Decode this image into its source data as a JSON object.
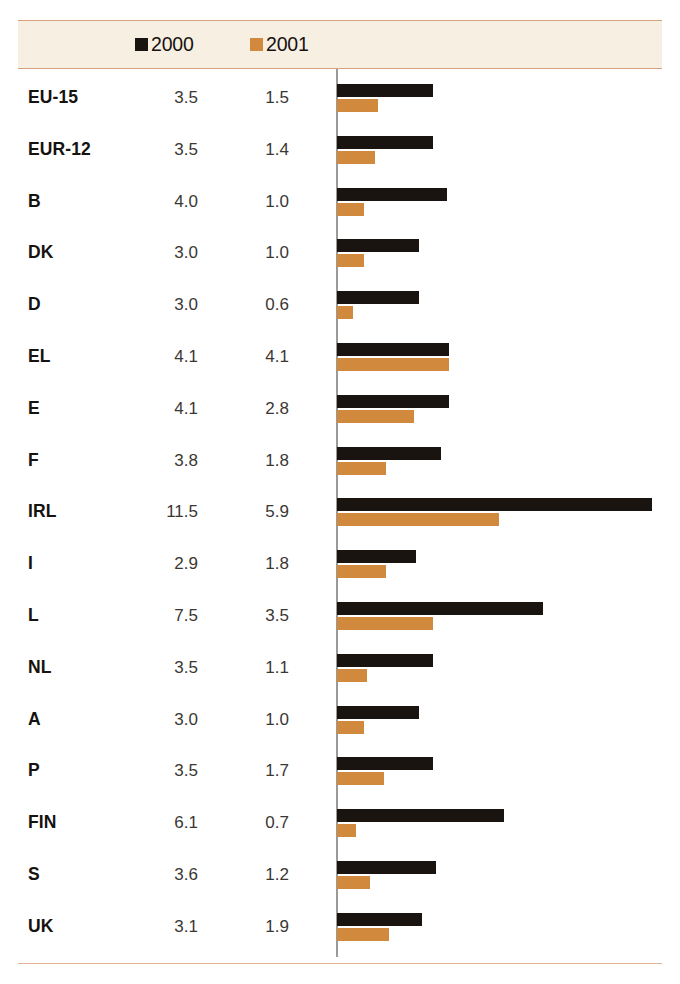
{
  "legend": {
    "entries": [
      {
        "label": "2000",
        "swatch_color": "#1a1410",
        "icon": "square-marker-icon"
      },
      {
        "label": "2001",
        "swatch_color": "#d1893d",
        "icon": "square-marker-icon"
      }
    ]
  },
  "colors": {
    "series_2000": "#1a1410",
    "series_2001": "#d1893d",
    "band_background": "#f7efe2",
    "band_rule": "#d9a183",
    "bottom_rule": "#e0b39a",
    "axis_line": "#9a9a98",
    "label_text": "#16120f",
    "value_text": "#3b3733"
  },
  "chart_data": {
    "type": "bar",
    "orientation": "horizontal",
    "title": "",
    "subtitle": "",
    "xlabel": "",
    "ylabel": "",
    "grid": false,
    "legend_position": "top",
    "axis_baseline": 0,
    "xlim": [
      0,
      12
    ],
    "categories": [
      "EU-15",
      "EUR-12",
      "B",
      "DK",
      "D",
      "EL",
      "E",
      "F",
      "IRL",
      "I",
      "L",
      "NL",
      "A",
      "P",
      "FIN",
      "S",
      "UK"
    ],
    "series": [
      {
        "name": "2000",
        "color": "#1a1410",
        "values": [
          3.5,
          3.5,
          4.0,
          3.0,
          3.0,
          4.1,
          4.1,
          3.8,
          11.5,
          2.9,
          7.5,
          3.5,
          3.0,
          3.5,
          6.1,
          3.6,
          3.1
        ]
      },
      {
        "name": "2001",
        "color": "#d1893d",
        "values": [
          1.5,
          1.4,
          1.0,
          1.0,
          0.6,
          4.1,
          2.8,
          1.8,
          5.9,
          1.8,
          3.5,
          1.1,
          1.0,
          1.7,
          0.7,
          1.2,
          1.9
        ]
      }
    ],
    "rows": [
      {
        "category": "EU-15",
        "v2000": "3.5",
        "v2001": "1.5"
      },
      {
        "category": "EUR-12",
        "v2000": "3.5",
        "v2001": "1.4"
      },
      {
        "category": "B",
        "v2000": "4.0",
        "v2001": "1.0"
      },
      {
        "category": "DK",
        "v2000": "3.0",
        "v2001": "1.0"
      },
      {
        "category": "D",
        "v2000": "3.0",
        "v2001": "0.6"
      },
      {
        "category": "EL",
        "v2000": "4.1",
        "v2001": "4.1"
      },
      {
        "category": "E",
        "v2000": "4.1",
        "v2001": "2.8"
      },
      {
        "category": "F",
        "v2000": "3.8",
        "v2001": "1.8"
      },
      {
        "category": "IRL",
        "v2000": "11.5",
        "v2001": "5.9"
      },
      {
        "category": "I",
        "v2000": "2.9",
        "v2001": "1.8"
      },
      {
        "category": "L",
        "v2000": "7.5",
        "v2001": "3.5"
      },
      {
        "category": "NL",
        "v2000": "3.5",
        "v2001": "1.1"
      },
      {
        "category": "A",
        "v2000": "3.0",
        "v2001": "1.0"
      },
      {
        "category": "P",
        "v2000": "3.5",
        "v2001": "1.7"
      },
      {
        "category": "FIN",
        "v2000": "6.1",
        "v2001": "0.7"
      },
      {
        "category": "S",
        "v2000": "3.6",
        "v2001": "1.2"
      },
      {
        "category": "UK",
        "v2000": "3.1",
        "v2001": "1.9"
      }
    ]
  },
  "scale": {
    "px_per_unit": 27.4
  }
}
